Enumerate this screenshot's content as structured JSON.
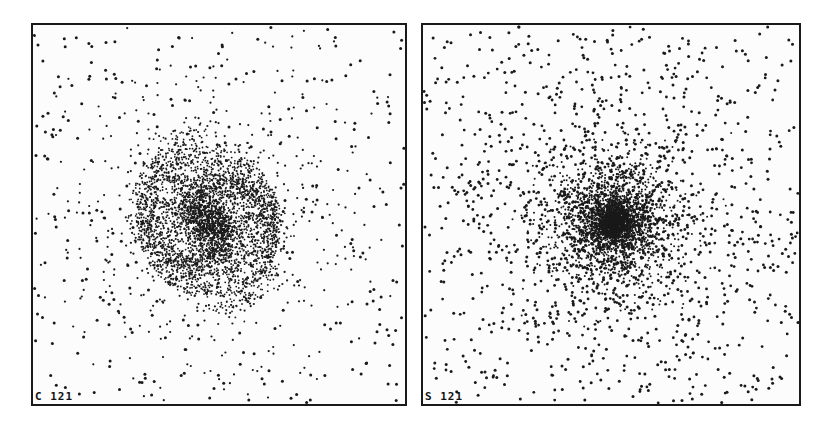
{
  "chart_data": [
    {
      "type": "scatter",
      "title": "",
      "label": "C 121",
      "description": "Particle distribution showing spiral (disk) galaxy structure with dense core and spiral arms",
      "xlabel": "",
      "ylabel": "",
      "grid": false,
      "center": [
        0.5,
        0.5
      ],
      "core_radius": 0.05,
      "disk_radius": 0.2,
      "spiral_arms": 2,
      "halo_points": 320,
      "disk_points": 3200
    },
    {
      "type": "scatter",
      "title": "",
      "label": "S 121",
      "description": "Particle distribution showing spheroidal concentration with dense center and extended halo",
      "xlabel": "",
      "ylabel": "",
      "grid": false,
      "center": [
        0.51,
        0.52
      ],
      "core_radius": 0.06,
      "halo_radius": 0.45,
      "halo_points": 1400,
      "bulge_points": 3000
    }
  ],
  "panels": {
    "left": {
      "label": "C 121",
      "x": 31,
      "y": 23,
      "w": 376,
      "h": 383
    },
    "right": {
      "label": "S 121",
      "x": 421,
      "y": 23,
      "w": 380,
      "h": 383
    }
  },
  "colors": {
    "dot": "#1a1a1a",
    "border": "#1a1a1a",
    "background": "#fcfcfc"
  }
}
